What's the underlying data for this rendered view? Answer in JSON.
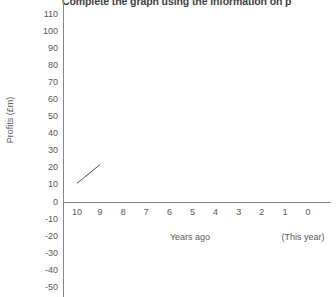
{
  "chart_data": {
    "type": "line",
    "title": "Complete the graph using the information on p",
    "xlabel": "Years ago",
    "ylabel": "Profits (£m)",
    "x_note": "(This year)",
    "categories": [
      "10",
      "9",
      "8",
      "7",
      "6",
      "5",
      "4",
      "3",
      "2",
      "1",
      "0"
    ],
    "xlim": [
      10,
      0
    ],
    "ylim": [
      -50,
      120
    ],
    "y_ticks": [
      "120",
      "110",
      "100",
      "90",
      "80",
      "70",
      "60",
      "50",
      "40",
      "30",
      "20",
      "10",
      "0",
      "-10",
      "-20",
      "-30",
      "-40",
      "-50"
    ],
    "grid": false,
    "legend": "none",
    "series": [
      {
        "name": "Profits",
        "points": [
          {
            "x": 10,
            "y": 11
          },
          {
            "x": 9,
            "y": 22
          }
        ],
        "color": "#4a4a4a"
      }
    ],
    "axis_color": "#868686"
  }
}
